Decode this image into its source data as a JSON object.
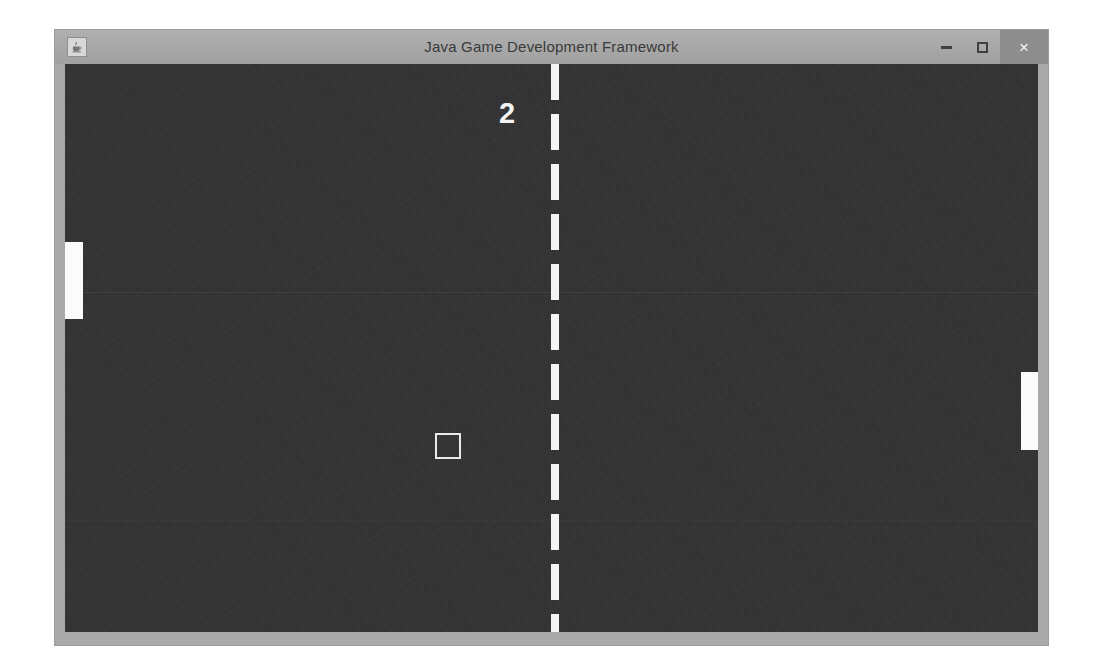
{
  "window": {
    "title": "Java Game Development Framework",
    "icon": "java-coffee-cup-icon",
    "controls": {
      "minimize_label": "–",
      "minimize_name": "minimize-icon",
      "maximize_label": "□",
      "maximize_name": "maximize-icon",
      "close_label": "×",
      "close_name": "close-icon"
    },
    "colors": {
      "titlebar": "#a9a9a9",
      "frame": "#a9a9a9",
      "close_button": "#8d8d8d",
      "title_text": "#3a3a3a"
    }
  },
  "game": {
    "name": "pong-game",
    "background_color": "#333335",
    "foreground_color": "#fbfbfb",
    "score": "2",
    "center_line": {
      "name": "center-dashed-line",
      "dash_length_px": 36,
      "gap_length_px": 14,
      "width_px": 8
    },
    "paddles": [
      {
        "name": "paddle-left",
        "side": "left",
        "x": 0,
        "y": 178,
        "width": 18,
        "height": 77,
        "color": "#fbfbfb"
      },
      {
        "name": "paddle-right",
        "side": "right",
        "x": 956,
        "y": 308,
        "width": 17,
        "height": 78,
        "color": "#fbfbfb"
      }
    ],
    "ball": {
      "name": "ball",
      "shape": "outlined-square",
      "x": 370,
      "y": 369,
      "size": 26,
      "border_color": "#e9e9e9"
    }
  }
}
